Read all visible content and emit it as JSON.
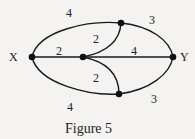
{
  "figure": {
    "caption": "Figure 5",
    "nodes": {
      "x": {
        "label": "X"
      },
      "y": {
        "label": "Y"
      }
    },
    "edges": {
      "x_top": {
        "weight": "4"
      },
      "top_y": {
        "weight": "3"
      },
      "x_center": {
        "weight": "2"
      },
      "center_top": {
        "weight": "2"
      },
      "center_y": {
        "weight": "4"
      },
      "center_bottom": {
        "weight": "2"
      },
      "x_bottom": {
        "weight": "4"
      },
      "bottom_y": {
        "weight": "3"
      }
    }
  }
}
